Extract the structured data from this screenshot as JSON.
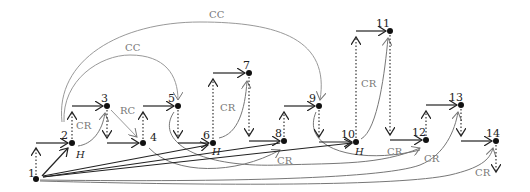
{
  "diagram": {
    "nodes": [
      {
        "id": "1",
        "x": 36,
        "y": 179
      },
      {
        "id": "2",
        "x": 72,
        "y": 143
      },
      {
        "id": "3",
        "x": 107,
        "y": 106
      },
      {
        "id": "4",
        "x": 143,
        "y": 143
      },
      {
        "id": "5",
        "x": 178,
        "y": 106
      },
      {
        "id": "6",
        "x": 213,
        "y": 143
      },
      {
        "id": "7",
        "x": 249,
        "y": 73
      },
      {
        "id": "8",
        "x": 284,
        "y": 141
      },
      {
        "id": "9",
        "x": 319,
        "y": 106
      },
      {
        "id": "10",
        "x": 356,
        "y": 142
      },
      {
        "id": "11",
        "x": 390,
        "y": 31
      },
      {
        "id": "12",
        "x": 426,
        "y": 140
      },
      {
        "id": "13",
        "x": 461,
        "y": 105
      },
      {
        "id": "14",
        "x": 496,
        "y": 141
      }
    ],
    "edge_labels": {
      "cc_outer": "CC",
      "cc_inner": "CC",
      "rc": "RC",
      "cr_2_3": "CR",
      "cr_6_7": "CR",
      "cr_10_11": "CR",
      "cr_8": "CR",
      "cr_12": "CR",
      "cr_13": "CR",
      "cr_14": "CR",
      "h_2": "H",
      "h_6": "H",
      "h_10": "H"
    },
    "colors": {
      "primary": "#222222",
      "secondary": "#777777"
    }
  }
}
